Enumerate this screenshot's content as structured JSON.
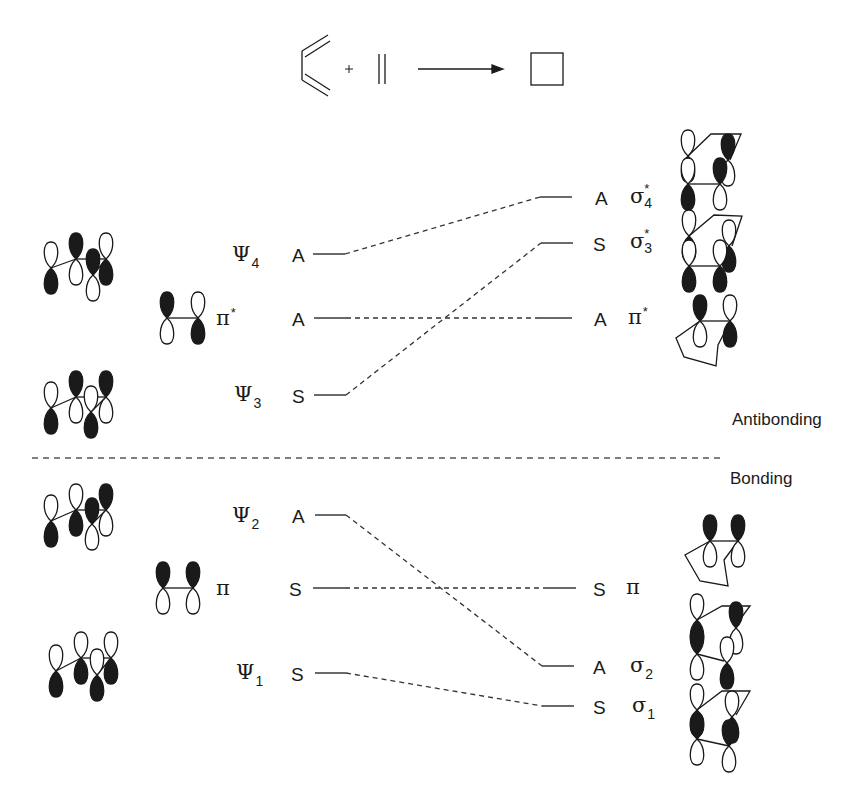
{
  "reaction": {
    "reactant1": "butadiene",
    "plus": "+",
    "reactant2": "ethylene",
    "product": "cyclobutene (square)"
  },
  "regions": {
    "upper": "Antibonding",
    "lower": "Bonding"
  },
  "left_levels": [
    {
      "id": "psi4",
      "symbol": "Ψ",
      "index": "4",
      "sym": "A",
      "y": 254
    },
    {
      "id": "pi_star_left",
      "symbol": "π",
      "sup": "*",
      "sym": "A",
      "y": 318
    },
    {
      "id": "psi3",
      "symbol": "Ψ",
      "index": "3",
      "sym": "S",
      "y": 395
    },
    {
      "id": "psi2",
      "symbol": "Ψ",
      "index": "2",
      "sym": "A",
      "y": 515
    },
    {
      "id": "pi_left",
      "symbol": "π",
      "sym": "S",
      "y": 588
    },
    {
      "id": "psi1",
      "symbol": "Ψ",
      "index": "1",
      "sym": "S",
      "y": 673
    }
  ],
  "right_levels": [
    {
      "id": "sigma4_star",
      "symbol": "σ",
      "index": "4",
      "sup": "*",
      "sym": "A",
      "y": 197
    },
    {
      "id": "sigma3_star",
      "symbol": "σ",
      "index": "3",
      "sup": "*",
      "sym": "S",
      "y": 243
    },
    {
      "id": "pi_star_right",
      "symbol": "π",
      "sup": "*",
      "sym": "A",
      "y": 318
    },
    {
      "id": "pi_right",
      "symbol": "π",
      "sym": "S",
      "y": 588
    },
    {
      "id": "sigma2",
      "symbol": "σ",
      "index": "2",
      "sym": "A",
      "y": 666
    },
    {
      "id": "sigma1",
      "symbol": "σ",
      "index": "1",
      "sym": "S",
      "y": 706
    }
  ],
  "correlations": [
    {
      "from": "psi4",
      "to": "sigma4_star"
    },
    {
      "from": "pi_star_left",
      "to": "pi_star_right"
    },
    {
      "from": "psi3",
      "to": "sigma3_star"
    },
    {
      "from": "psi2",
      "to": "sigma2"
    },
    {
      "from": "pi_left",
      "to": "pi_right"
    },
    {
      "from": "psi1",
      "to": "sigma1"
    }
  ],
  "labels": {
    "psi4": {
      "greek": "Ψ",
      "sub": "4",
      "sym": "A"
    },
    "pi_star_left": {
      "greek": "π",
      "sup": "*",
      "sym": "A"
    },
    "psi3": {
      "greek": "Ψ",
      "sub": "3",
      "sym": "S"
    },
    "psi2": {
      "greek": "Ψ",
      "sub": "2",
      "sym": "A"
    },
    "pi_left": {
      "greek": "π",
      "sym": "S"
    },
    "psi1": {
      "greek": "Ψ",
      "sub": "1",
      "sym": "S"
    },
    "sigma4_star": {
      "greek": "σ",
      "sup": "*",
      "sub": "4",
      "sym": "A"
    },
    "sigma3_star": {
      "greek": "σ",
      "sup": "*",
      "sub": "3",
      "sym": "S"
    },
    "pi_star_right": {
      "greek": "π",
      "sup": "*",
      "sym": "A"
    },
    "pi_right": {
      "greek": "π",
      "sym": "S"
    },
    "sigma2": {
      "greek": "σ",
      "sub": "2",
      "sym": "A"
    },
    "sigma1": {
      "greek": "σ",
      "sub": "1",
      "sym": "S"
    }
  },
  "colors": {
    "ink": "#1a1a1a",
    "background": "#ffffff"
  }
}
